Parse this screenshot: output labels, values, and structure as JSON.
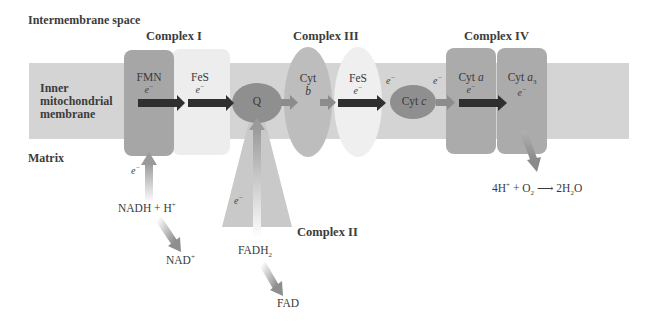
{
  "regions": {
    "intermembrane": "Intermembrane space",
    "membrane_line1": "Inner",
    "membrane_line2": "mitochondrial",
    "membrane_line3": "membrane",
    "matrix": "Matrix"
  },
  "complexes": {
    "c1": "Complex I",
    "c2": "Complex II",
    "c3": "Complex III",
    "c4": "Complex IV"
  },
  "carriers": {
    "fmn": "FMN",
    "fes1": "FeS",
    "q": "Q",
    "cytb_1": "Cyt",
    "cytb_2": "b",
    "fes2": "FeS",
    "cytc_1": "Cyt",
    "cytc_2": "c",
    "cyta_1": "Cyt",
    "cyta_2": "a",
    "cyta3_1": "Cyt",
    "cyta3_2": "a",
    "cyta3_sub": "3"
  },
  "electron": "e",
  "electron_sup": "−",
  "substrates": {
    "nadh": "NADH + H",
    "nadh_sup": "+",
    "nad": "NAD",
    "nad_sup": "+",
    "fadh2": "FADH",
    "fadh2_sub": "2",
    "fad": "FAD",
    "water_1": "4H",
    "water_1_sup": "+",
    "water_2": " + O",
    "water_2_sub": "2",
    "water_arrow": " ⟶ ",
    "water_3": "2H",
    "water_3_sub": "2",
    "water_4": "O"
  },
  "colors": {
    "membrane": "#d3d3d3",
    "complex_dark": "#a9a9a9",
    "complex_light": "#ebebeb",
    "carrier": "#8e8e8e",
    "arrow_dark": "#2e2e2e",
    "arrow_mid": "#8a8a8a"
  }
}
